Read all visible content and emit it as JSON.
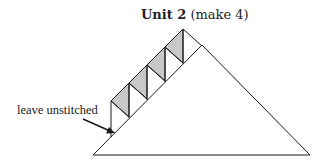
{
  "title": {
    "bold": "Unit 2",
    "regular": " (make 4)"
  },
  "annotation": {
    "label": "leave unstitched"
  },
  "colors": {
    "line": "#1a1a1a",
    "shaded": "#c8c8c8",
    "fill": "#ffffff"
  },
  "diagram": {
    "large_triangle": {
      "points": "93,155 310,155 202,45"
    },
    "strip_units": 4
  }
}
